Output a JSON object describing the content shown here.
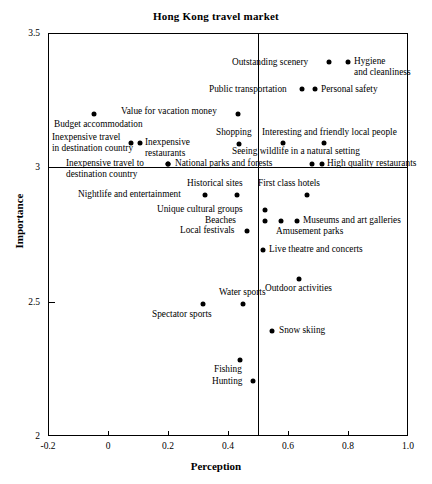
{
  "chart_data": {
    "type": "scatter",
    "title": "Hong Kong travel market",
    "xlabel": "Perception",
    "ylabel": "Importance",
    "xlim": [
      -0.2,
      1.0
    ],
    "ylim": [
      2.0,
      3.5
    ],
    "xticks": [
      "-0.2",
      "0",
      "0.2",
      "0.4",
      "0.6",
      "0.8",
      "1.0"
    ],
    "xtick_values": [
      -0.2,
      0,
      0.2,
      0.4,
      0.6,
      0.8,
      1.0
    ],
    "yticks": [
      "3.5",
      "3",
      "2.5",
      "2"
    ],
    "ytick_values": [
      3.5,
      3.0,
      2.5,
      2.0
    ],
    "grid": false,
    "legend": "none",
    "reference_lines": [
      {
        "orientation": "vertical",
        "value": 0.5
      },
      {
        "orientation": "horizontal",
        "value": 3.0
      }
    ],
    "points": [
      {
        "label": "Outstanding scenery",
        "x": 0.735,
        "y": 3.392,
        "px": 329,
        "py": 62,
        "lx": 232,
        "ly": 57,
        "align": "left"
      },
      {
        "label": "Hygiene\nand cleanliness",
        "x": 0.8,
        "y": 3.392,
        "px": 348,
        "py": 62,
        "lx": 354,
        "ly": 56,
        "align": "left"
      },
      {
        "label": "Public transportation",
        "x": 0.647,
        "y": 3.292,
        "px": 302,
        "py": 89,
        "lx": 209,
        "ly": 84,
        "align": "left"
      },
      {
        "label": "Personal safety",
        "x": 0.69,
        "y": 3.292,
        "px": 315,
        "py": 89,
        "lx": 321,
        "ly": 84,
        "align": "left"
      },
      {
        "label": "Budget accommodation",
        "x": -0.047,
        "y": 3.2,
        "px": 94,
        "py": 114,
        "lx": 54,
        "ly": 119,
        "align": "left"
      },
      {
        "label": "Value for vacation money",
        "x": 0.433,
        "y": 3.2,
        "px": 238,
        "py": 114,
        "lx": 121,
        "ly": 106,
        "align": "left"
      },
      {
        "label": "Inexpensive travel\nin destination country",
        "x": 0.077,
        "y": 3.092,
        "px": 131,
        "py": 143,
        "lx": 52,
        "ly": 132,
        "align": "left"
      },
      {
        "label": "Inexpensive\nrestaurants",
        "x": 0.107,
        "y": 3.092,
        "px": 140,
        "py": 143,
        "lx": 145,
        "ly": 137,
        "align": "left"
      },
      {
        "label": "Shopping",
        "x": 0.437,
        "y": 3.096,
        "px": 239,
        "py": 144,
        "lx": 216,
        "ly": 127,
        "align": "left"
      },
      {
        "label": "Interesting and friendly local people",
        "x": 0.583,
        "y": 3.096,
        "px": 283,
        "py": 143,
        "lx": 262,
        "ly": 127,
        "align": "left"
      },
      {
        "label": "Seeing wildlife in a natural setting",
        "x": 0.72,
        "y": 3.096,
        "px": 324,
        "py": 143,
        "lx": 232,
        "ly": 146,
        "align": "left"
      },
      {
        "label": "Inexpensive travel to\ndestination country",
        "x": 0.2,
        "y": 3.018,
        "px": 168,
        "py": 164,
        "lx": 66,
        "ly": 158,
        "align": "left"
      },
      {
        "label": "National parks and forests",
        "x": 0.4,
        "y": 3.018,
        "px": 168,
        "py": 164,
        "lx": 175,
        "ly": 158,
        "align": "left"
      },
      {
        "label": "High quality restaurants",
        "x": 0.68,
        "y": 3.018,
        "px": 312,
        "py": 164,
        "lx": 327,
        "ly": 158,
        "align": "left"
      },
      {
        "label": "",
        "x": 0.713,
        "y": 3.018,
        "px": 322,
        "py": 164,
        "lx": 0,
        "ly": 0,
        "align": "left"
      },
      {
        "label": "Nightlife and entertainment",
        "x": 0.323,
        "y": 2.903,
        "px": 205,
        "py": 195,
        "lx": 78,
        "ly": 189,
        "align": "left"
      },
      {
        "label": "Historical sites",
        "x": 0.43,
        "y": 2.903,
        "px": 237,
        "py": 195,
        "lx": 187,
        "ly": 178,
        "align": "left"
      },
      {
        "label": "First class hotels",
        "x": 0.663,
        "y": 2.903,
        "px": 307,
        "py": 195,
        "lx": 258,
        "ly": 178,
        "align": "left"
      },
      {
        "label": "Unique cultural groups",
        "x": 0.523,
        "y": 2.845,
        "px": 265,
        "py": 210,
        "lx": 157,
        "ly": 204,
        "align": "left"
      },
      {
        "label": "Beaches",
        "x": 0.523,
        "y": 2.805,
        "px": 265,
        "py": 221,
        "lx": 205,
        "ly": 215,
        "align": "left"
      },
      {
        "label": "Amusement parks",
        "x": 0.577,
        "y": 2.805,
        "px": 281,
        "py": 221,
        "lx": 276,
        "ly": 226,
        "align": "left"
      },
      {
        "label": "Museums and art galleries",
        "x": 0.63,
        "y": 2.805,
        "px": 297,
        "py": 221,
        "lx": 303,
        "ly": 215,
        "align": "left"
      },
      {
        "label": "Local festivals",
        "x": 0.463,
        "y": 2.768,
        "px": 247,
        "py": 231,
        "lx": 180,
        "ly": 225,
        "align": "left"
      },
      {
        "label": "Live theatre and concerts",
        "x": 0.517,
        "y": 2.698,
        "px": 263,
        "py": 250,
        "lx": 269,
        "ly": 244,
        "align": "left"
      },
      {
        "label": "Outdoor activities",
        "x": 0.637,
        "y": 2.59,
        "px": 299,
        "py": 279,
        "lx": 265,
        "ly": 283,
        "align": "left"
      },
      {
        "label": "Water sports",
        "x": 0.45,
        "y": 2.5,
        "px": 243,
        "py": 304,
        "lx": 219,
        "ly": 287,
        "align": "left"
      },
      {
        "label": "Spectator sports",
        "x": 0.317,
        "y": 2.5,
        "px": 203,
        "py": 304,
        "lx": 152,
        "ly": 309,
        "align": "left"
      },
      {
        "label": "Snow skiing",
        "x": 0.547,
        "y": 2.4,
        "px": 272,
        "py": 331,
        "lx": 279,
        "ly": 325,
        "align": "left"
      },
      {
        "label": "Fishing",
        "x": 0.44,
        "y": 2.29,
        "px": 240,
        "py": 360,
        "lx": 214,
        "ly": 364,
        "align": "left"
      },
      {
        "label": "Hunting",
        "x": 0.483,
        "y": 2.21,
        "px": 253,
        "py": 381,
        "lx": 212,
        "ly": 376,
        "align": "left"
      }
    ]
  },
  "axes": {
    "frame": {
      "left": 48,
      "top": 33,
      "width": 360,
      "height": 403
    }
  }
}
